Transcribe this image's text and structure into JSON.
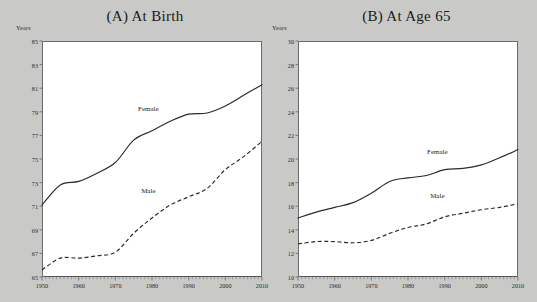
{
  "figure": {
    "background_color": "#c9c9c7",
    "plot_background_color": "#ffffff",
    "line_color": "#2a2a2a"
  },
  "panels": [
    {
      "id": "panel-a",
      "title": "(A) At Birth",
      "axis_unit_label": "Years"
    },
    {
      "id": "panel-b",
      "title": "(B) At Age 65",
      "axis_unit_label": "Years"
    }
  ],
  "chart_data": [
    {
      "type": "line",
      "title": "(A) At Birth",
      "xlabel": "",
      "ylabel": "Years",
      "xlim": [
        1950,
        2010
      ],
      "ylim": [
        65,
        85
      ],
      "ytick_step": 2,
      "yticks": [
        65,
        67,
        69,
        71,
        73,
        75,
        77,
        79,
        81,
        83,
        85
      ],
      "xticks": [
        1950,
        1960,
        1970,
        1980,
        1990,
        2000,
        2010
      ],
      "xtick_minor_step": 1,
      "grid": false,
      "legend": "inline-labels",
      "x": [
        1950,
        1955,
        1960,
        1965,
        1970,
        1975,
        1980,
        1985,
        1990,
        1995,
        2000,
        2005,
        2010
      ],
      "series": [
        {
          "name": "Female",
          "style": "solid",
          "values": [
            71.1,
            72.8,
            73.1,
            73.8,
            74.7,
            76.6,
            77.4,
            78.2,
            78.8,
            78.9,
            79.5,
            80.4,
            81.3
          ],
          "label_x": 1979,
          "label_y": 79.2
        },
        {
          "name": "Male",
          "style": "dashed",
          "values": [
            65.6,
            66.6,
            66.6,
            66.8,
            67.1,
            68.7,
            70.0,
            71.1,
            71.8,
            72.5,
            74.1,
            75.2,
            76.5
          ],
          "label_x": 1979,
          "label_y": 72.3
        }
      ]
    },
    {
      "type": "line",
      "title": "(B) At Age 65",
      "xlabel": "",
      "ylabel": "Years",
      "xlim": [
        1950,
        2010
      ],
      "ylim": [
        10,
        30
      ],
      "ytick_step": 2,
      "yticks": [
        10,
        12,
        14,
        16,
        18,
        20,
        22,
        24,
        26,
        28,
        30
      ],
      "xticks": [
        1950,
        1960,
        1970,
        1980,
        1990,
        2000,
        2010
      ],
      "xtick_minor_step": 1,
      "grid": false,
      "legend": "inline-labels",
      "x": [
        1950,
        1955,
        1960,
        1965,
        1970,
        1975,
        1980,
        1985,
        1990,
        1995,
        2000,
        2005,
        2010
      ],
      "series": [
        {
          "name": "Female",
          "style": "solid",
          "values": [
            15.0,
            15.5,
            15.9,
            16.3,
            17.1,
            18.1,
            18.4,
            18.6,
            19.1,
            19.2,
            19.5,
            20.1,
            20.8
          ],
          "label_x": 1988,
          "label_y": 20.6
        },
        {
          "name": "Male",
          "style": "dashed",
          "values": [
            12.8,
            13.0,
            13.0,
            12.9,
            13.1,
            13.7,
            14.2,
            14.5,
            15.1,
            15.4,
            15.7,
            15.9,
            16.2
          ],
          "label_x": 1988,
          "label_y": 16.9
        }
      ]
    }
  ]
}
